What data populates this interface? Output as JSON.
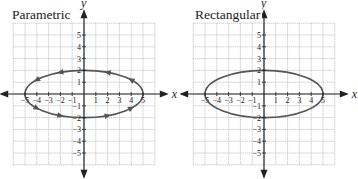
{
  "colors": {
    "curve": "#555555",
    "axis": "#222222",
    "grid": "#b9b9b9",
    "text": "#222222"
  },
  "chart_data": [
    {
      "type": "line",
      "title": "Parametric",
      "xlabel": "x",
      "ylabel": "y",
      "xlim": [
        -6,
        6
      ],
      "ylim": [
        -6,
        6
      ],
      "grid": true,
      "x_ticks": [
        -5,
        -4,
        -3,
        -2,
        -1,
        1,
        2,
        3,
        4,
        5
      ],
      "y_ticks": [
        -5,
        -4,
        -3,
        -2,
        -1,
        1,
        2,
        3,
        4,
        5
      ],
      "series": [
        {
          "name": "ellipse (parametric)",
          "equation": "x = 5cos t, y = 2sin t",
          "semi_major_x": 5,
          "semi_minor_y": 2,
          "orientation": "counterclockwise",
          "direction_arrows": [
            {
              "x": -4,
              "y": 1.2
            },
            {
              "x": -2,
              "y": 1.83
            },
            {
              "x": 2,
              "y": 1.83
            },
            {
              "x": 4,
              "y": 1.2
            },
            {
              "x": -4,
              "y": -1.2
            },
            {
              "x": -2,
              "y": -1.83
            },
            {
              "x": 2,
              "y": -1.83
            },
            {
              "x": 4,
              "y": -1.2
            }
          ]
        }
      ]
    },
    {
      "type": "line",
      "title": "Rectangular",
      "xlabel": "x",
      "ylabel": "y",
      "xlim": [
        -6,
        6
      ],
      "ylim": [
        -6,
        6
      ],
      "grid": true,
      "x_ticks": [
        -5,
        -4,
        -3,
        -2,
        -1,
        1,
        2,
        3,
        4,
        5
      ],
      "y_ticks": [
        -5,
        -4,
        -3,
        -2,
        -1,
        1,
        2,
        3,
        4,
        5
      ],
      "series": [
        {
          "name": "ellipse (rectangular)",
          "equation": "x^2/25 + y^2/4 = 1",
          "semi_major_x": 5,
          "semi_minor_y": 2
        }
      ]
    }
  ],
  "panels": [
    {
      "title": "Parametric",
      "x_label": "x",
      "y_label": "y"
    },
    {
      "title": "Rectangular",
      "x_label": "x",
      "y_label": "y"
    }
  ]
}
